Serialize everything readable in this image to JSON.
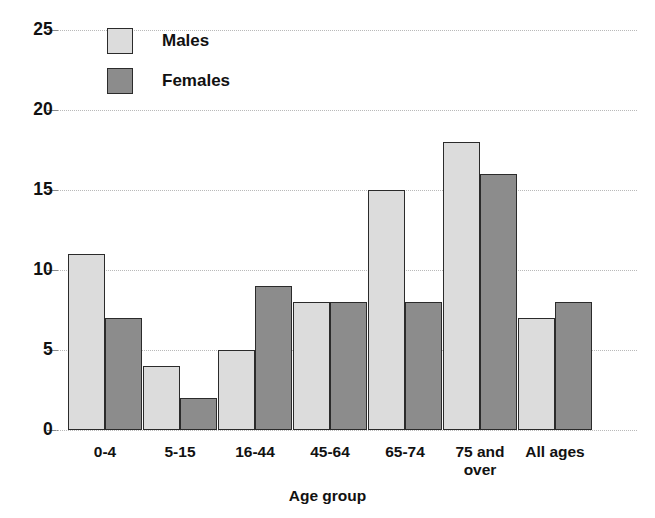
{
  "chart_data": {
    "type": "bar",
    "title": "",
    "subtitle": "",
    "xlabel": "Age group",
    "ylabel": "",
    "ylim": [
      0,
      25
    ],
    "yticks": [
      0,
      5,
      10,
      15,
      20,
      25
    ],
    "ytick_labels": [
      "0",
      "5",
      "10",
      "15",
      "20",
      "25"
    ],
    "grid": true,
    "grid_axis": "y",
    "legend_position": "top-left",
    "categories": [
      "0-4",
      "5-15",
      "16-44",
      "45-64",
      "65-74",
      "75 and\nover",
      "All ages"
    ],
    "series": [
      {
        "name": "Males",
        "color": "#dcdcdc",
        "values": [
          11,
          4,
          5,
          8,
          15,
          18,
          7
        ]
      },
      {
        "name": "Females",
        "color": "#8c8c8c",
        "values": [
          7,
          2,
          9,
          8,
          8,
          16,
          8
        ]
      }
    ]
  },
  "legend": {
    "items": [
      {
        "label": "Males"
      },
      {
        "label": "Females"
      }
    ]
  },
  "colors": {
    "males": "#dcdcdc",
    "females": "#8c8c8c",
    "bar_outline": "#2b2b2b",
    "gridline": "#b9b9b9",
    "text": "#111111",
    "background": "#ffffff"
  }
}
